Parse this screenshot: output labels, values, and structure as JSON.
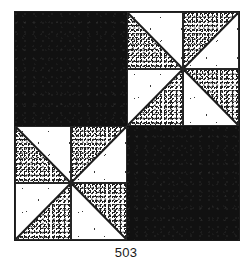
{
  "figure": {
    "caption": "503",
    "block_name": "quilt-block",
    "grid": {
      "rows": 2,
      "cols": 2
    },
    "colors": {
      "solid": "#111111",
      "stipple_dot": "#1f1f1f",
      "background": "#ffffff",
      "line": "#262626",
      "caption_text": "#1a1a1a"
    },
    "quadrants": [
      {
        "position": "top-left",
        "fill": "solid",
        "label": "solid dark square"
      },
      {
        "position": "top-right",
        "fill": "pinwheel",
        "label": "pinwheel of half-square triangles"
      },
      {
        "position": "bottom-left",
        "fill": "pinwheel",
        "label": "pinwheel of half-square triangles"
      },
      {
        "position": "bottom-right",
        "fill": "solid",
        "label": "solid dark square"
      }
    ],
    "pinwheel_units": [
      {
        "position": "top-left",
        "stipple_half": "lower-left",
        "diagonal": "anti"
      },
      {
        "position": "top-right",
        "stipple_half": "upper-left",
        "diagonal": "main"
      },
      {
        "position": "bottom-left",
        "stipple_half": "lower-right",
        "diagonal": "main"
      },
      {
        "position": "bottom-right",
        "stipple_half": "upper-right",
        "diagonal": "anti"
      }
    ]
  }
}
